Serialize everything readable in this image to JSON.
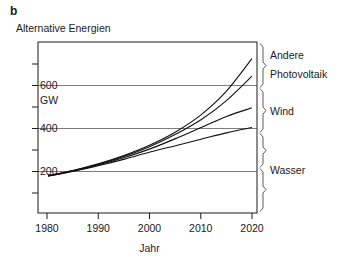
{
  "panel": {
    "label": "b",
    "title": "Alternative Energien"
  },
  "chart_data": {
    "type": "line",
    "title": "Alternative Energien",
    "xlabel": "Jahr",
    "ylabel": "GW",
    "xlim": [
      1978,
      2021
    ],
    "ylim": [
      0,
      800
    ],
    "grid": true,
    "gridlines_y": [
      200,
      400,
      600
    ],
    "legend_position": "right-outside",
    "y_ticks": [
      0,
      100,
      200,
      300,
      400,
      500,
      600,
      700,
      800
    ],
    "y_tick_labels": [
      "",
      "",
      "200",
      "",
      "400",
      "",
      "600",
      "",
      ""
    ],
    "x_ticks": [
      1980,
      1990,
      2000,
      2010,
      2020
    ],
    "x_tick_labels": [
      "1980",
      "1990",
      "2000",
      "2010",
      "2020"
    ],
    "x": [
      1980,
      1985,
      1990,
      1995,
      2000,
      2005,
      2010,
      2015,
      2020
    ],
    "note": "cumulative stacked totals, GW installed capacity",
    "series": [
      {
        "name": "Wasser",
        "values": [
          172,
          195,
          222,
          252,
          285,
          315,
          345,
          375,
          400
        ]
      },
      {
        "name": "Wind",
        "values": [
          173,
          197,
          226,
          260,
          300,
          348,
          400,
          452,
          492
        ]
      },
      {
        "name": "Photovoltaik",
        "values": [
          174,
          199,
          229,
          266,
          311,
          368,
          436,
          526,
          640
        ]
      },
      {
        "name": "Andere",
        "values": [
          175,
          200,
          231,
          270,
          318,
          379,
          459,
          570,
          722
        ]
      }
    ]
  },
  "axis": {
    "y_unit": "GW",
    "y_labels": [
      "600",
      "400",
      "200"
    ],
    "x_label": "Jahr",
    "x_labels": [
      "1980",
      "1990",
      "2000",
      "2010",
      "2020"
    ]
  },
  "series_labels": {
    "andere": "Andere",
    "photovoltaik": "Photovoltaik",
    "wind": "Wind",
    "wasser": "Wasser"
  },
  "colors": {
    "curve": "#111111",
    "frame": "#1a1a1a",
    "grid": "#444444",
    "text": "#1a1a1a"
  }
}
